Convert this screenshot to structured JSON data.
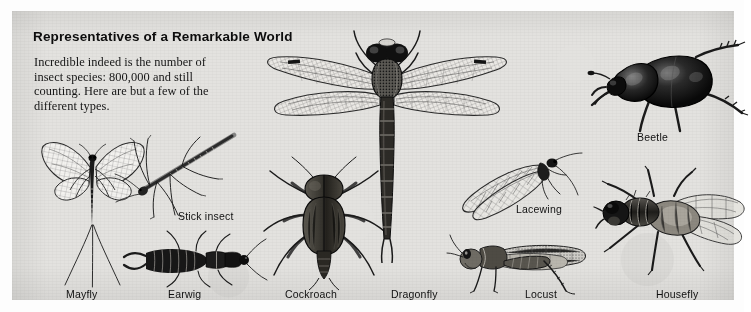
{
  "page": {
    "background_color": "#fdfdfd",
    "panel_color": "#e3e2df",
    "ink_color": "#1a1a1a"
  },
  "header": {
    "title": "Representatives of a Remarkable World",
    "intro": "Incredible indeed is the number of insect species: 800,000 and still counting. Here are but a few of the different types."
  },
  "figures": [
    {
      "id": "mayfly",
      "label": "Mayfly",
      "label_x": 54,
      "label_y": 283
    },
    {
      "id": "stick-insect",
      "label": "Stick insect",
      "label_x": 166,
      "label_y": 205
    },
    {
      "id": "earwig",
      "label": "Earwig",
      "label_x": 156,
      "label_y": 283
    },
    {
      "id": "cockroach",
      "label": "Cockroach",
      "label_x": 273,
      "label_y": 283
    },
    {
      "id": "dragonfly",
      "label": "Dragonfly",
      "label_x": 379,
      "label_y": 283
    },
    {
      "id": "lacewing",
      "label": "Lacewing",
      "label_x": 504,
      "label_y": 198
    },
    {
      "id": "locust",
      "label": "Locust",
      "label_x": 513,
      "label_y": 283
    },
    {
      "id": "beetle",
      "label": "Beetle",
      "label_x": 625,
      "label_y": 126
    },
    {
      "id": "housefly",
      "label": "Housefly",
      "label_x": 644,
      "label_y": 283
    }
  ]
}
